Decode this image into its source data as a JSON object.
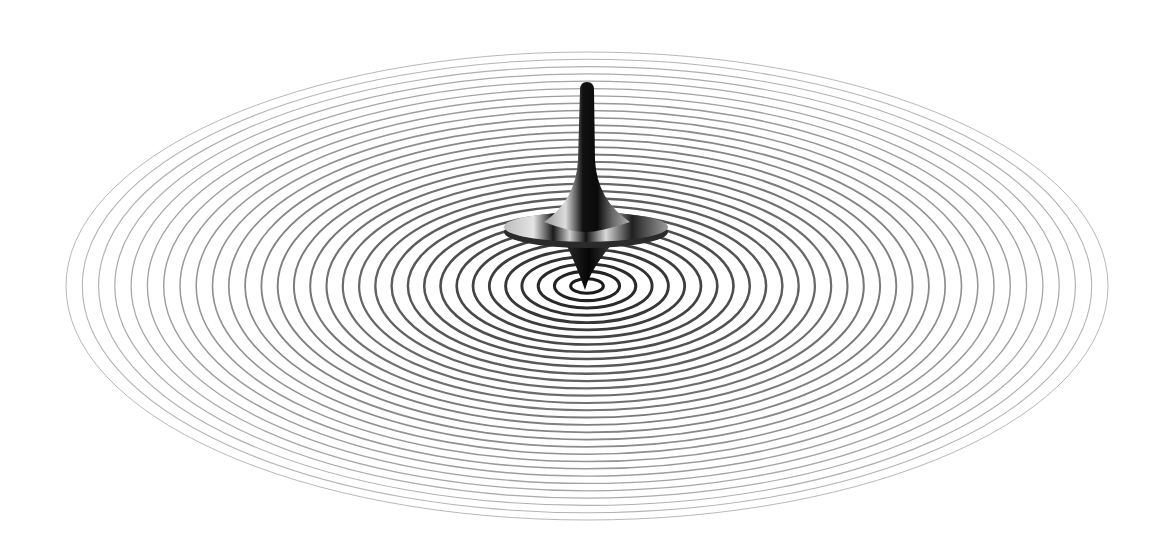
{
  "image": {
    "subject": "spinning top on concentric ripple ellipses",
    "background_color": "#ffffff",
    "ripples": {
      "center": [
        587,
        286
      ],
      "outer_rx": 521,
      "outer_ry": 234,
      "count": 32,
      "outer_color": "#b8b8b8",
      "inner_color": "#111111"
    },
    "top": {
      "color_dark": "#0a0a0a",
      "color_light": "#c8c8c8"
    }
  }
}
